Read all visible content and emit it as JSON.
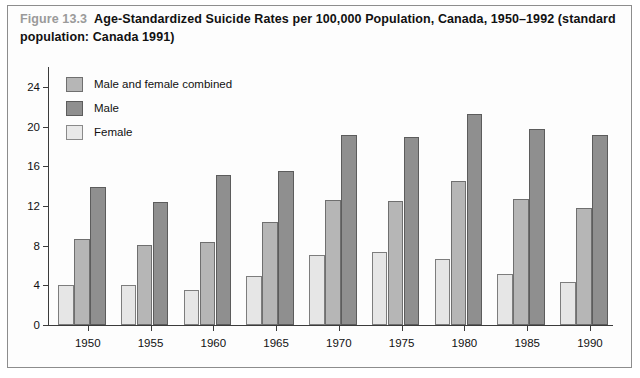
{
  "figure": {
    "number_label": "Figure 13.3",
    "title": "Age-Standardized Suicide Rates per 100,000 Population, Canada, 1950–1992 (standard population: Canada 1991)"
  },
  "legend": {
    "position": "top-left-inside-plot",
    "items": [
      {
        "label": "Male and female combined",
        "key": "combined",
        "color": "#b6b6b6"
      },
      {
        "label": "Male",
        "key": "male",
        "color": "#8f8f8f"
      },
      {
        "label": "Female",
        "key": "female",
        "color": "#e6e6e6"
      }
    ]
  },
  "chart_data": {
    "type": "bar",
    "title": "Age-Standardized Suicide Rates per 100,000 Population, Canada, 1950–1992 (standard population: Canada 1991)",
    "xlabel": "",
    "ylabel": "",
    "categories": [
      "1950",
      "1955",
      "1960",
      "1965",
      "1970",
      "1975",
      "1980",
      "1985",
      "1990"
    ],
    "series": [
      {
        "name": "Female",
        "color": "#e6e6e6",
        "values": [
          4.0,
          4.0,
          3.5,
          4.9,
          7.1,
          7.4,
          6.7,
          5.1,
          4.3
        ]
      },
      {
        "name": "Male and female combined",
        "color": "#b6b6b6",
        "values": [
          8.7,
          8.1,
          8.4,
          10.4,
          12.6,
          12.5,
          14.5,
          12.7,
          11.8
        ]
      },
      {
        "name": "Male",
        "color": "#8f8f8f",
        "values": [
          13.9,
          12.4,
          15.1,
          15.5,
          19.1,
          18.9,
          21.3,
          19.8,
          19.1
        ]
      }
    ],
    "ylim": [
      0,
      26
    ],
    "yticks": [
      0,
      4,
      8,
      12,
      16,
      20,
      24
    ],
    "ytick_labels": [
      "0",
      "4",
      "8",
      "12",
      "16",
      "20",
      "24"
    ],
    "grid": false,
    "legend_position": "upper left"
  }
}
